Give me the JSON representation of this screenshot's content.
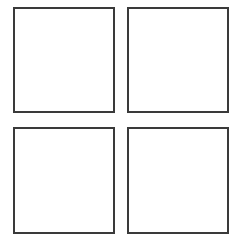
{
  "layout": {
    "rows": 2,
    "columns": 2,
    "border_color": "#3a3a3a",
    "background": "#ffffff"
  },
  "boxes": [
    {
      "id": "box-top-left",
      "x": 13,
      "y": 7,
      "width": 102,
      "height": 106,
      "label": ""
    },
    {
      "id": "box-top-right",
      "x": 127,
      "y": 7,
      "width": 102,
      "height": 106,
      "label": ""
    },
    {
      "id": "box-bottom-left",
      "x": 13,
      "y": 127,
      "width": 102,
      "height": 107,
      "label": ""
    },
    {
      "id": "box-bottom-right",
      "x": 127,
      "y": 127,
      "width": 102,
      "height": 107,
      "label": ""
    }
  ]
}
